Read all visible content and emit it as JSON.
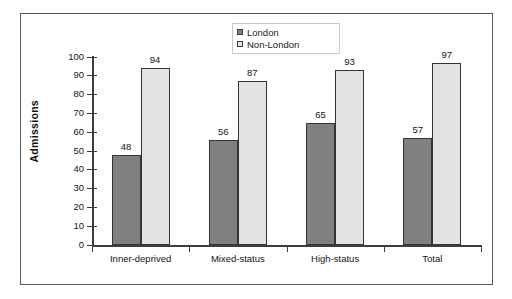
{
  "chart_data": {
    "type": "bar",
    "title": "",
    "subtitle": "",
    "xlabel": "",
    "ylabel": "Admissions",
    "ylim": [
      0,
      100
    ],
    "y_ticks": [
      0,
      10,
      20,
      30,
      40,
      50,
      60,
      70,
      80,
      90,
      100
    ],
    "y_tick_labels": [
      "0",
      "10",
      "20",
      "30",
      "40",
      "50",
      "60",
      "70",
      "80",
      "90",
      "100"
    ],
    "grid": false,
    "legend_position": "top-center",
    "categories": [
      "Inner-deprived",
      "Mixed-status",
      "High-status",
      "Total"
    ],
    "series": [
      {
        "name": "London",
        "color": "#808080",
        "values": [
          48,
          56,
          65,
          57
        ],
        "value_labels": [
          "48",
          "56",
          "65",
          "57"
        ]
      },
      {
        "name": "Non-London",
        "color": "#e3e3e3",
        "values": [
          94,
          87,
          93,
          97
        ],
        "value_labels": [
          "94",
          "87",
          "93",
          "97"
        ]
      }
    ]
  },
  "legend": {
    "items": [
      {
        "label": "London",
        "swatch": "legend-swatch-dark"
      },
      {
        "label": "Non-London",
        "swatch": "legend-swatch-light"
      }
    ]
  },
  "axes": {
    "y_title": "Admissions"
  },
  "colors": {
    "series_london": "#808080",
    "series_non_london": "#e3e3e3",
    "frame": "#59595b",
    "axis": "#3d3d3d",
    "text": "#131313",
    "background": "#ffffff"
  }
}
